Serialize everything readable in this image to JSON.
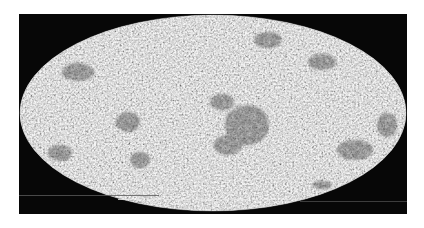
{
  "figure": {
    "type": "all-sky map",
    "projection": "Mollweide",
    "colormap": "grayscale",
    "frame_color": "#070707",
    "background_color": "#ffffff",
    "sky_base_color": "#b8b8b8",
    "cluster_color": "#3a3a3a"
  },
  "layout": {
    "frame": {
      "x": 19,
      "y": 14,
      "width": 388,
      "height": 200
    },
    "ellipse": {
      "cx": 213,
      "cy": 113,
      "rx": 193,
      "ry": 98
    }
  },
  "dark_regions": [
    {
      "name": "center-cluster",
      "cx": 247,
      "cy": 125,
      "rx": 22,
      "ry": 20
    },
    {
      "name": "center-upper",
      "cx": 222,
      "cy": 102,
      "rx": 12,
      "ry": 8
    },
    {
      "name": "center-lower",
      "cx": 228,
      "cy": 145,
      "rx": 14,
      "ry": 10
    },
    {
      "name": "left-upper",
      "cx": 78,
      "cy": 72,
      "rx": 16,
      "ry": 9
    },
    {
      "name": "left-mid",
      "cx": 128,
      "cy": 122,
      "rx": 12,
      "ry": 10
    },
    {
      "name": "left-lower",
      "cx": 60,
      "cy": 153,
      "rx": 12,
      "ry": 8
    },
    {
      "name": "top-right",
      "cx": 268,
      "cy": 40,
      "rx": 14,
      "ry": 8
    },
    {
      "name": "right-upper",
      "cx": 322,
      "cy": 62,
      "rx": 14,
      "ry": 8
    },
    {
      "name": "right-edge",
      "cx": 387,
      "cy": 125,
      "rx": 10,
      "ry": 12
    },
    {
      "name": "right-lower",
      "cx": 355,
      "cy": 150,
      "rx": 18,
      "ry": 10
    },
    {
      "name": "bottom-right",
      "cx": 322,
      "cy": 185,
      "rx": 10,
      "ry": 4
    },
    {
      "name": "mid-lower",
      "cx": 140,
      "cy": 160,
      "rx": 10,
      "ry": 8
    }
  ],
  "artifacts": [
    {
      "name": "grey-scanline-left",
      "x": 19,
      "y": 195,
      "width": 140,
      "color": "#5a5a5a"
    },
    {
      "name": "white-dashed-line",
      "x": 118,
      "y": 199,
      "width": 180,
      "color": "#e8e8e8"
    },
    {
      "name": "grey-scanline-right",
      "x": 300,
      "y": 201,
      "width": 107,
      "color": "#4a4a4a"
    }
  ]
}
